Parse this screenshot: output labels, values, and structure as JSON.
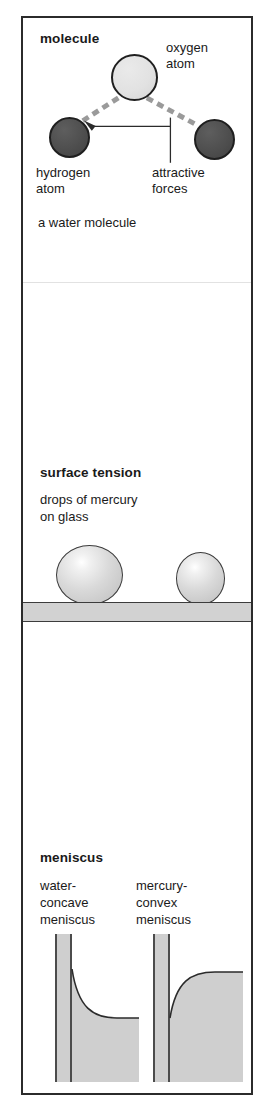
{
  "figure": {
    "sections": [
      {
        "id": "molecule",
        "heading": "molecule",
        "labels": {
          "oxygen": "oxygen\natom",
          "oxygen_line1": "oxygen",
          "oxygen_line2": "atom",
          "hydrogen_line1": "hydrogen",
          "hydrogen_line2": "atom",
          "forces_line1": "attractive",
          "forces_line2": "forces",
          "caption": "a water molecule"
        },
        "atoms": [
          {
            "name": "oxygen atom",
            "fill": "#e2e2e2",
            "diameter_px": 47
          },
          {
            "name": "hydrogen atom",
            "fill": "#4d4d4d",
            "diameter_px": 41
          },
          {
            "name": "hydrogen atom",
            "fill": "#4d4d4d",
            "diameter_px": 41
          }
        ],
        "bond_style": "dashed",
        "bond_color": "#9a9a9a"
      },
      {
        "id": "surface-tension",
        "heading": "surface tension",
        "labels": {
          "description_line1": "drops of mercury",
          "description_line2": "on glass"
        },
        "drops": [
          {
            "name": "large mercury drop"
          },
          {
            "name": "small mercury drop"
          }
        ],
        "surface": "glass slab"
      },
      {
        "id": "meniscus",
        "heading": "meniscus",
        "labels": {
          "water_line1": "water-",
          "water_line2": "concave",
          "water_line3": "meniscus",
          "mercury_line1": "mercury-",
          "mercury_line2": "convex",
          "mercury_line3": "meniscus"
        },
        "diagrams": [
          {
            "name": "water concave meniscus",
            "curve": "concave"
          },
          {
            "name": "mercury convex meniscus",
            "curve": "convex"
          }
        ]
      }
    ],
    "colors": {
      "border": "#2b2b2b",
      "oxygen": "#e2e2e2",
      "hydrogen": "#4d4d4d",
      "glass": "#d2d2d2",
      "liquid": "#cfcfcf",
      "background": "#ffffff"
    }
  }
}
